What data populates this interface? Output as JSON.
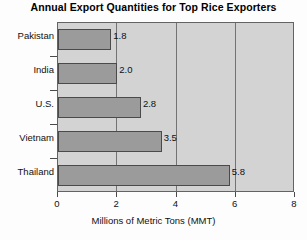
{
  "chart_data": {
    "type": "bar",
    "orientation": "horizontal",
    "title": "Annual Export Quantities for Top Rice Exporters",
    "categories": [
      "Pakistan",
      "India",
      "U.S.",
      "Vietnam",
      "Thailand"
    ],
    "values": [
      1.8,
      2.0,
      2.8,
      3.5,
      5.8
    ],
    "value_labels": [
      "1.8",
      "2.0",
      "2.8",
      "3.5",
      "5.8"
    ],
    "xlabel": "Millions of Metric Tons (MMT)",
    "ylabel": "",
    "xlim": [
      0,
      8
    ],
    "xticks": [
      0,
      2,
      4,
      6,
      8
    ],
    "xtick_labels": [
      "0",
      "2",
      "4",
      "6",
      "8"
    ],
    "gridlines": [
      2,
      4,
      6
    ],
    "grid": true,
    "legend": false,
    "colors": {
      "bar_fill": "#9b9b9b",
      "bar_border": "#4a4a4a",
      "plot_background": "#d3d3d3",
      "gridline": "#737373",
      "axis": "#4a4a4a",
      "text": "#111111",
      "page_background": "#fdfdfd"
    }
  }
}
